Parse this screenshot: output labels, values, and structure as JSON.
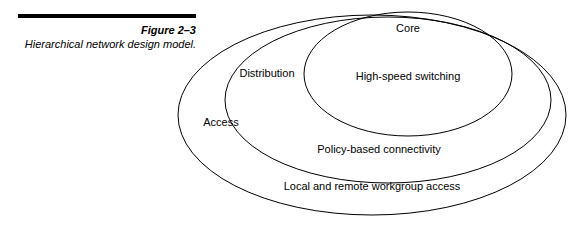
{
  "figure": {
    "number": "Figure 2–3",
    "title": "Hierarchical network design model."
  },
  "diagram": {
    "type": "concentric-ellipses",
    "labels": {
      "core": "Core",
      "core_detail": "High-speed switching",
      "distribution": "Distribution",
      "distribution_detail": "Policy-based connectivity",
      "access": "Access",
      "access_detail": "Local and remote workgroup access"
    },
    "colors": {
      "stroke": "#000000",
      "background": "#ffffff",
      "rule": "#000000"
    }
  }
}
